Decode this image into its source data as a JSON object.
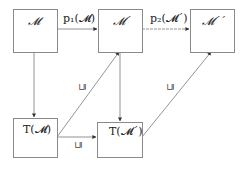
{
  "nodes": {
    "m": {
      "label": "𝓜"
    },
    "m1": {
      "label": "𝓜´"
    },
    "m2": {
      "label": "𝓜´´"
    },
    "tm": {
      "label": "T(𝓜)"
    },
    "tm1": {
      "label": "T(𝓜´)"
    }
  },
  "edges": {
    "p1": {
      "label": "p₁(𝓜)"
    },
    "p2": {
      "label": "p₂(𝓜´)"
    },
    "sq_tm_m1": {
      "label": "⊑"
    },
    "sq_tm_tm1": {
      "label": "⊑"
    },
    "sq_tm1_m2": {
      "label": "⊑"
    }
  },
  "colors": {
    "line": "#777777",
    "border": "#8a8a8a"
  }
}
